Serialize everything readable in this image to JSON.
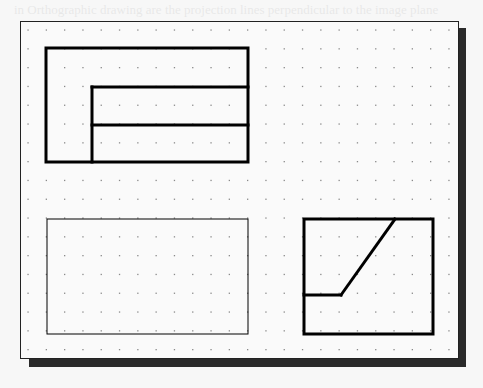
{
  "figure": {
    "type": "orthographic-sketch-grid",
    "sheet": {
      "background": "#fafafa",
      "border_color": "#222222",
      "shadow_color": "#2a2a2a"
    },
    "grid": {
      "dot_color": "#8a8a8a",
      "x_start": 28,
      "x_step": 18.3,
      "columns": 24,
      "y_start": 30,
      "y_step": 18.8,
      "rows": 18
    },
    "views": [
      {
        "name": "top-left-view",
        "stroke_width": 3,
        "outer_rect": {
          "x": 46,
          "y": 48,
          "w": 202,
          "h": 114
        },
        "lines": [
          {
            "x1": 92,
            "y1": 87,
            "x2": 92,
            "y2": 162
          },
          {
            "x1": 92,
            "y1": 87,
            "x2": 248,
            "y2": 87
          },
          {
            "x1": 92,
            "y1": 125,
            "x2": 248,
            "y2": 125
          }
        ]
      },
      {
        "name": "bottom-left-blank-view",
        "stroke_width": 1,
        "outer_rect": {
          "x": 47,
          "y": 219,
          "w": 201,
          "h": 115
        },
        "lines": []
      },
      {
        "name": "bottom-right-view",
        "stroke_width": 3,
        "outer_rect": {
          "x": 304,
          "y": 219,
          "w": 129,
          "h": 115
        },
        "lines": [
          {
            "x1": 304,
            "y1": 295,
            "x2": 341,
            "y2": 295
          },
          {
            "x1": 341,
            "y1": 295,
            "x2": 395,
            "y2": 219
          }
        ]
      }
    ]
  },
  "bleed_through_text": [
    "in Orthographic drawing are the projection lines perpendicular to the image plane",
    "commands",
    "Line",
    "Circle",
    "center of your board",
    "Notice the line in your drawing"
  ]
}
